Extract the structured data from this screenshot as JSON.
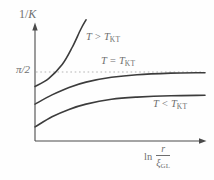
{
  "colors": {
    "background": "#fefefe",
    "curve": "#3c3c3c",
    "axis": "#4a4a4a",
    "dashed": "#b5b5b5",
    "text": "#6e6e6e"
  },
  "labels": {
    "y_axis": {
      "prefix": "1/",
      "symbol": "K"
    },
    "pi_half": "π/2",
    "curves": [
      {
        "main": "T > T",
        "sub": "KT"
      },
      {
        "main": "T = T",
        "sub": "KT"
      },
      {
        "main": "T < T",
        "sub": "KT"
      }
    ],
    "x_axis": {
      "ln": "ln",
      "numerator": "r",
      "denominator": "ξ",
      "denominator_sub": "GL"
    }
  },
  "chart_data": {
    "type": "line",
    "title": "",
    "xlabel": "ln (r/ξ_GL)",
    "ylabel": "1/K",
    "axis_style": "schematic axes with arrowheads; no numeric scale; x normalized 0–1",
    "yticks": [
      {
        "value": 1.5708,
        "label": "π/2"
      }
    ],
    "legend_position": "inline curve labels",
    "grid": false,
    "series": [
      {
        "name": "T > T_KT",
        "x": [
          0,
          0.08,
          0.16,
          0.22,
          0.27,
          0.3
        ],
        "y": [
          1.24,
          1.42,
          1.74,
          2.14,
          2.55,
          2.76
        ]
      },
      {
        "name": "T = T_KT",
        "x": [
          0,
          0.1,
          0.2,
          0.3,
          0.45,
          0.6,
          0.8,
          1.0
        ],
        "y": [
          0.84,
          1.05,
          1.22,
          1.34,
          1.45,
          1.51,
          1.545,
          1.555
        ]
      },
      {
        "name": "T < T_KT",
        "x": [
          0,
          0.1,
          0.2,
          0.3,
          0.45,
          0.6,
          0.8,
          1.0
        ],
        "y": [
          0.32,
          0.55,
          0.72,
          0.84,
          0.95,
          1.0,
          1.03,
          1.04
        ]
      }
    ],
    "annotations": [
      {
        "type": "hline",
        "y": 1.5708,
        "label": "π/2",
        "style": "dashed"
      }
    ]
  }
}
